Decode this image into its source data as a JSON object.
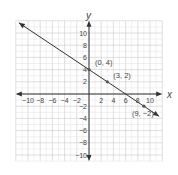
{
  "chart_data": {
    "type": "line",
    "title": "",
    "xlabel": "x",
    "ylabel": "y",
    "xlim": [
      -12,
      12
    ],
    "ylim": [
      -11,
      12
    ],
    "grid": true,
    "x_ticks": [
      -10,
      -8,
      -6,
      -4,
      -2,
      2,
      4,
      6,
      8,
      10
    ],
    "y_ticks": [
      -10,
      -8,
      -6,
      -4,
      -2,
      2,
      4,
      6,
      8,
      10
    ],
    "x_tick_labels": [
      "−10",
      "−8",
      "−6",
      "−4",
      "−2",
      "2",
      "4",
      "6",
      "8",
      "10"
    ],
    "y_tick_labels": [
      "−10",
      "−8",
      "−6",
      "−4",
      "−2",
      "2",
      "4",
      "6",
      "8",
      "10"
    ],
    "series": [
      {
        "name": "line",
        "slope": -0.6667,
        "intercept": 4,
        "x_range": [
          -11.5,
          11.5
        ],
        "color": "#333333"
      }
    ],
    "points": [
      {
        "x": 0,
        "y": 4,
        "label": "(0, 4)"
      },
      {
        "x": 3,
        "y": 2,
        "label": "(3, 2)"
      },
      {
        "x": 9,
        "y": -2,
        "label": "(9, −2)"
      }
    ]
  }
}
